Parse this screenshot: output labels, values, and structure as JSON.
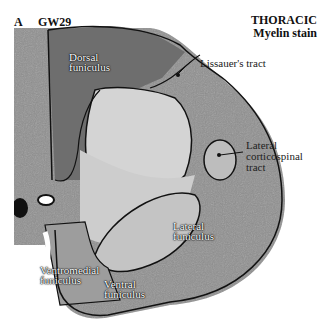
{
  "figure": {
    "panel_letter": "A",
    "age": "GW29",
    "title_line1": "THORACIC",
    "title_line2": "Myelin stain"
  },
  "labels": {
    "dorsal_funiculus": [
      "Dorsal",
      "funiculus"
    ],
    "lissauers_tract": "Lissauer's tract",
    "lateral_corticospinal": [
      "Lateral",
      "corticospinal",
      "tract"
    ],
    "lateral_funiculus": [
      "Lateral",
      "funiculus"
    ],
    "ventromedial_funiculus": [
      "Ventromedial",
      "funiculus"
    ],
    "ventral_funiculus": [
      "Ventral",
      "funiculus"
    ]
  },
  "colors": {
    "outline": "#111111",
    "white_matter_dark": "#7a7a7a",
    "white_matter": "#9a9a9a",
    "gray_matter": "#c8c8c8",
    "background": "#ffffff"
  }
}
